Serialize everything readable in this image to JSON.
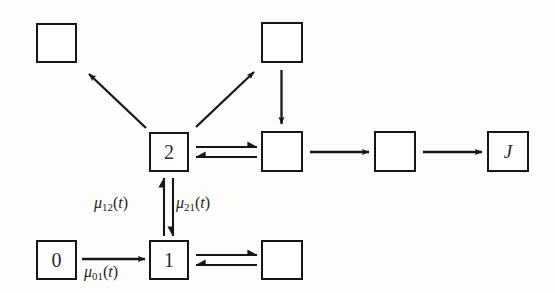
{
  "diagram": {
    "background_color": "#fdfdfc",
    "stroke_color": "#161616",
    "text_color": "#2a2a2a",
    "nodes": [
      {
        "id": "top_left",
        "label": "",
        "x": 36,
        "y": 23,
        "w": 41,
        "h": 40,
        "italic": false
      },
      {
        "id": "top_right",
        "label": "",
        "x": 261,
        "y": 22,
        "w": 42,
        "h": 41,
        "italic": false
      },
      {
        "id": "state_2",
        "label": "2",
        "x": 149,
        "y": 132,
        "w": 40,
        "h": 40,
        "italic": false
      },
      {
        "id": "mid_right_1",
        "label": "",
        "x": 261,
        "y": 131,
        "w": 42,
        "h": 41,
        "italic": false
      },
      {
        "id": "mid_right_2",
        "label": "",
        "x": 374,
        "y": 131,
        "w": 42,
        "h": 41,
        "italic": false
      },
      {
        "id": "state_J",
        "label": "J",
        "x": 487,
        "y": 131,
        "w": 42,
        "h": 41,
        "italic": true
      },
      {
        "id": "state_0",
        "label": "0",
        "x": 36,
        "y": 240,
        "w": 41,
        "h": 40,
        "italic": false
      },
      {
        "id": "state_1",
        "label": "1",
        "x": 149,
        "y": 240,
        "w": 40,
        "h": 40,
        "italic": false
      },
      {
        "id": "bot_right",
        "label": "",
        "x": 261,
        "y": 240,
        "w": 42,
        "h": 40,
        "italic": false
      }
    ],
    "edge_labels": [
      {
        "id": "mu_12",
        "mu": "μ",
        "sub": "12",
        "arg": "(t)",
        "x": 94,
        "y": 195
      },
      {
        "id": "mu_21",
        "mu": "μ",
        "sub": "21",
        "arg": "(t)",
        "x": 176,
        "y": 195
      },
      {
        "id": "mu_01",
        "mu": "μ",
        "sub": "01",
        "arg": "(t)",
        "x": 84,
        "y": 264
      }
    ],
    "edges": [
      {
        "id": "edge-2-to-topleft",
        "kind": "single-arrow",
        "from": "state_2",
        "to": "top_left"
      },
      {
        "id": "edge-2-to-topright",
        "kind": "single-arrow",
        "from": "state_2",
        "to": "top_right"
      },
      {
        "id": "edge-topright-down",
        "kind": "single-arrow",
        "from": "top_right",
        "to": "mid_right_1"
      },
      {
        "id": "edge-2-midright1",
        "kind": "double-harpoon",
        "from": "state_2",
        "to": "mid_right_1"
      },
      {
        "id": "edge-midright1-midright2",
        "kind": "single-arrow",
        "from": "mid_right_1",
        "to": "mid_right_2"
      },
      {
        "id": "edge-midright2-J",
        "kind": "single-arrow",
        "from": "mid_right_2",
        "to": "state_J"
      },
      {
        "id": "edge-1-2-vertical",
        "kind": "double-harpoon-v",
        "from": "state_1",
        "to": "state_2"
      },
      {
        "id": "edge-0-to-1",
        "kind": "single-arrow",
        "from": "state_0",
        "to": "state_1"
      },
      {
        "id": "edge-1-botright",
        "kind": "double-harpoon",
        "from": "state_1",
        "to": "bot_right"
      }
    ]
  }
}
